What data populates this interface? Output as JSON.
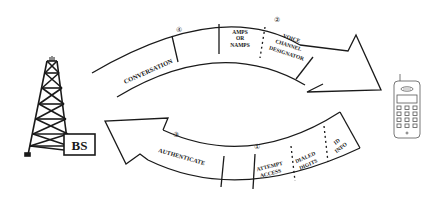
{
  "diagram": {
    "nodes": {
      "base_station": {
        "label": "BS",
        "icon": "cell-tower-icon"
      },
      "mobile": {
        "icon": "mobile-phone-icon"
      }
    },
    "upper_arrow": {
      "direction": "BS to mobile",
      "steps": [
        {
          "number": "④",
          "label": "CONVERSATION"
        },
        {
          "number": "②",
          "segments": [
            "AMPS OR NAMPS",
            "VOICE CHANNEL DESIGNATOR"
          ]
        }
      ],
      "segment_lines": {
        "amps_1": "AMPS",
        "amps_2": "OR",
        "amps_3": "NAMPS",
        "vcd_1": "VOICE",
        "vcd_2": "CHANNEL",
        "vcd_3": "DESIGNATOR"
      }
    },
    "lower_arrow": {
      "direction": "mobile to BS",
      "steps": [
        {
          "number": "③",
          "label": "AUTHENTICATE"
        },
        {
          "number": "①",
          "segments": [
            "ATTEMPT ACCESS",
            "DIALED DIGITS",
            "ID INFO"
          ]
        }
      ],
      "segment_lines": {
        "aa_1": "ATTEMPT",
        "aa_2": "ACCESS",
        "dd_1": "DIALED",
        "dd_2": "DIGITS",
        "id_1": "ID",
        "id_2": "INFO"
      }
    },
    "labels": {
      "step1": "①",
      "step2": "②",
      "step3": "③",
      "step4": "④",
      "bs": "BS",
      "conversation": "CONVERSATION",
      "authenticate": "AUTHENTICATE"
    },
    "colors": {
      "stroke": "#1a1a1a",
      "background": "#ffffff"
    }
  }
}
